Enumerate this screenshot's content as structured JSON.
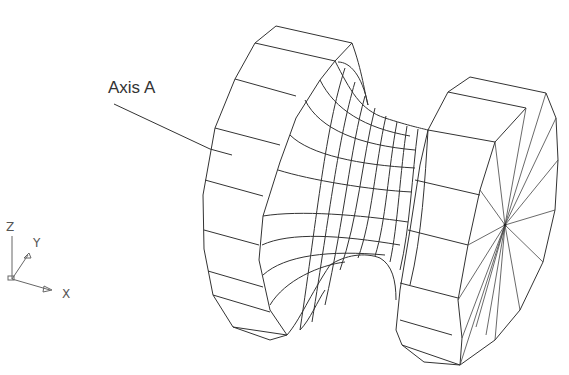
{
  "diagram": {
    "type": "wireframe-3d-cad-drawing",
    "callout": {
      "label": "Axis A"
    },
    "triad": {
      "x_label": "X",
      "y_label": "Y",
      "z_label": "Z"
    }
  },
  "colors": {
    "background": "#ffffff",
    "lines": "#333333",
    "text": "#333333"
  }
}
